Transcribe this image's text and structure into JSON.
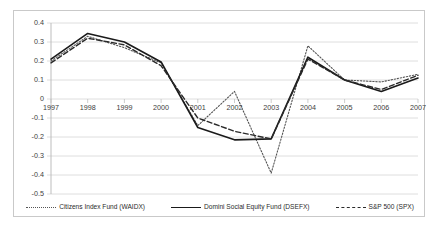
{
  "chart_data": {
    "type": "line",
    "title": "",
    "xlabel": "",
    "ylabel": "",
    "categories": [
      "1997",
      "1998",
      "1999",
      "2000",
      "2001",
      "2002",
      "2003",
      "2004",
      "2005",
      "2006",
      "2007"
    ],
    "ylim": [
      -0.5,
      0.4
    ],
    "ytick_labels": [
      "0.4",
      "0.3",
      "0.2",
      "0.1",
      "0",
      "-0.1",
      "-0.2",
      "-0.3",
      "-0.4",
      "-0.5"
    ],
    "ytick_values": [
      0.4,
      0.3,
      0.2,
      0.1,
      0,
      -0.1,
      -0.2,
      -0.3,
      -0.4,
      -0.5
    ],
    "grid": true,
    "legend_position": "bottom",
    "series": [
      {
        "name": "Citizens Index Fund (WAIDX)",
        "style": "dotted",
        "color": "#555555",
        "values": [
          0.2,
          0.33,
          0.27,
          0.19,
          -0.14,
          0.04,
          -0.39,
          0.28,
          0.1,
          0.09,
          0.13
        ]
      },
      {
        "name": "Domini Social Equity Fund (DSEFX)",
        "style": "solid",
        "color": "#1a1a1a",
        "values": [
          0.21,
          0.345,
          0.3,
          0.195,
          -0.15,
          -0.215,
          -0.21,
          0.22,
          0.1,
          0.04,
          0.11
        ]
      },
      {
        "name": "S&P 500 (SPX)",
        "style": "dashed",
        "color": "#2a2a2a",
        "values": [
          0.19,
          0.32,
          0.285,
          0.175,
          -0.1,
          -0.17,
          -0.21,
          0.21,
          0.1,
          0.05,
          0.125
        ]
      }
    ]
  },
  "legend": {
    "items": [
      {
        "label": "Citizens Index Fund (WAIDX)"
      },
      {
        "label": "Domini Social Equity Fund (DSEFX)"
      },
      {
        "label": "S&P 500 (SPX)"
      }
    ]
  }
}
